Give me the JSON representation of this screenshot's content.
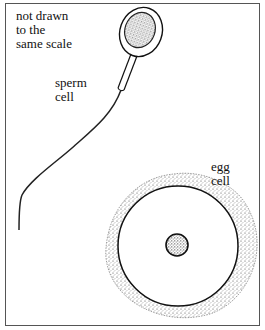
{
  "diagram": {
    "scale_note": [
      "not drawn",
      "to the",
      "same scale"
    ],
    "labels": {
      "sperm": [
        "sperm",
        "cell"
      ],
      "egg": [
        "egg",
        "cell"
      ]
    },
    "colors": {
      "stroke": "#111111",
      "stipple": "#444444",
      "frame": "#555555",
      "background": "#ffffff"
    }
  }
}
